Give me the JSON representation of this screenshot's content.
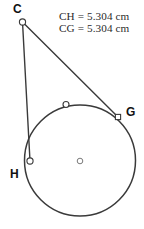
{
  "figure": {
    "background_color": "#ffffff",
    "stroke_color": "#3a3a3a",
    "label_color": "#111111",
    "text_color": "#2b2b2b",
    "width": 144,
    "height": 229
  },
  "measurements": {
    "ch_label": "CH = 5.304 cm",
    "cg_label": "CG = 5.304 cm"
  },
  "labels": {
    "c": "C",
    "g": "G",
    "h": "H"
  },
  "chart_data": {
    "type": "diagram",
    "shapes": [
      {
        "name": "circle",
        "kind": "circle",
        "cx": 80,
        "cy": 160.5,
        "r": 55.5,
        "stroke": "#3a3a3a",
        "stroke_width": 1.5,
        "fill": "none"
      },
      {
        "name": "segment-c-g",
        "kind": "line",
        "x1": 22.5,
        "y1": 22,
        "x2": 118,
        "y2": 117,
        "stroke": "#3a3a3a",
        "stroke_width": 1.4
      },
      {
        "name": "segment-c-h",
        "kind": "line",
        "x1": 22.5,
        "y1": 22,
        "x2": 30,
        "y2": 161,
        "stroke": "#3a3a3a",
        "stroke_width": 1.4
      }
    ],
    "points": [
      {
        "name": "C",
        "x": 22.5,
        "y": 22,
        "marker": "circle",
        "r": 3.1,
        "label": "C",
        "label_pos": "above-left"
      },
      {
        "name": "G",
        "x": 118,
        "y": 117,
        "marker": "square",
        "size": 5.2,
        "label": "G",
        "label_pos": "right"
      },
      {
        "name": "H",
        "x": 30,
        "y": 161,
        "marker": "circle",
        "r": 3.1,
        "label": "H",
        "label_pos": "below-left"
      },
      {
        "name": "center",
        "x": 80,
        "y": 161,
        "marker": "circle",
        "r": 2.8,
        "label": "",
        "label_pos": "none"
      },
      {
        "name": "arc-point",
        "x": 66,
        "y": 104.5,
        "marker": "circle",
        "r": 3.0,
        "label": "",
        "label_pos": "none"
      }
    ],
    "annotations": [
      {
        "name": "ch-measure",
        "text": "CH = 5.304 cm",
        "x": 59,
        "y": 20
      },
      {
        "name": "cg-measure",
        "text": "CG = 5.304 cm",
        "x": 59,
        "y": 31.5
      }
    ]
  }
}
